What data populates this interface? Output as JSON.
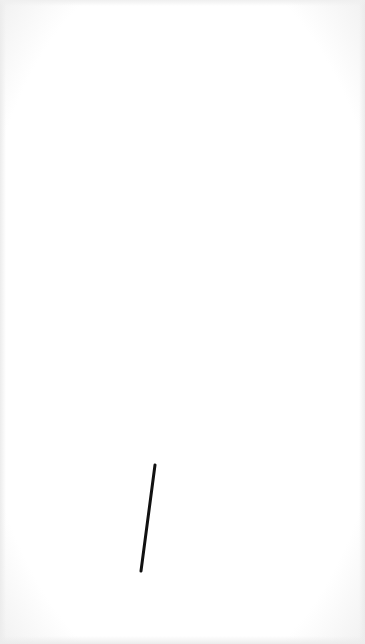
{
  "canvas": {
    "background": "#ffffff",
    "strokes": [
      {
        "color": "#111111",
        "width": 3,
        "x1": 155,
        "y1": 465,
        "x2": 141,
        "y2": 571
      }
    ]
  }
}
